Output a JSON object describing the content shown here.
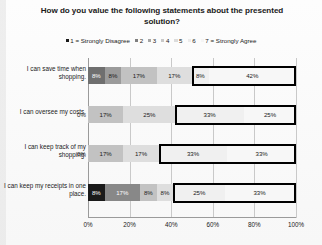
{
  "chart_data": {
    "type": "bar",
    "subtype": "100%-stacked-horizontal-bar",
    "title": "How do you value the following statements about the presented solution?",
    "xlabel": "",
    "ylabel": "",
    "xlim": [
      0,
      100
    ],
    "xticks": [
      "0%",
      "20%",
      "40%",
      "60%",
      "80%",
      "100%"
    ],
    "xtick_values": [
      0,
      20,
      40,
      60,
      80,
      100
    ],
    "grid": true,
    "legend_position": "top",
    "legend": [
      {
        "label": "1 = Strongly Disagree",
        "color": "#1a1a1a"
      },
      {
        "label": "2",
        "color": "#7f7f7f"
      },
      {
        "label": "3",
        "color": "#a6a6a6"
      },
      {
        "label": "4",
        "color": "#c9c9c9"
      },
      {
        "label": "5",
        "color": "#dcdcdc"
      },
      {
        "label": "6",
        "color": "#ebebeb"
      },
      {
        "label": "7 = Strongly Agree",
        "color": "#f5f5f5"
      }
    ],
    "categories": [
      "I can save time when shopping.",
      "I can oversee my costs.",
      "I can keep track of my shopping.",
      "I can keep my receipts in one place."
    ],
    "series": [
      {
        "name": "1 = Strongly Disagree",
        "color": "#1a1a1a",
        "values": [
          8,
          0,
          0,
          8
        ]
      },
      {
        "name": "2",
        "color": "#7f7f7f",
        "values": [
          8,
          17,
          17,
          17
        ]
      },
      {
        "name": "3",
        "color": "#a6a6a6",
        "values": [
          17,
          25,
          17,
          0
        ]
      },
      {
        "name": "4",
        "color": "#c9c9c9",
        "values": [
          17,
          0,
          0,
          8
        ]
      },
      {
        "name": "5",
        "color": "#dcdcdc",
        "values": [
          8,
          33,
          33,
          8
        ]
      },
      {
        "name": "6",
        "color": "#ebebeb",
        "values": [
          0,
          0,
          0,
          25
        ]
      },
      {
        "name": "7 = Strongly Agree",
        "color": "#f5f5f5",
        "values": [
          42,
          25,
          33,
          33
        ]
      }
    ],
    "bars": [
      {
        "category": "I can save time when shopping.",
        "segments": [
          {
            "series": "1",
            "value": 8,
            "label": "8%",
            "color": "#6f6f6f",
            "label_color": "#ffffff",
            "outside": false
          },
          {
            "series": "2",
            "value": 8,
            "label": "8%",
            "color": "#9b9b9b",
            "label_color": "#1a1a1a",
            "outside": false
          },
          {
            "series": "3",
            "value": 17,
            "label": "17%",
            "color": "#c2c2c2",
            "label_color": "#1a1a1a",
            "outside": false
          },
          {
            "series": "4",
            "value": 17,
            "label": "17%",
            "color": "#dedede",
            "label_color": "#1a1a1a",
            "outside": false
          },
          {
            "series": "5",
            "value": 8,
            "label": "8%",
            "color": "#f0f0f0",
            "label_color": "#1a1a1a",
            "outside": false
          },
          {
            "series": "7",
            "value": 42,
            "label": "42%",
            "color": "#f7f7f7",
            "label_color": "#1a1a1a",
            "outside": false
          }
        ],
        "highlight": {
          "start": 50,
          "end": 100
        }
      },
      {
        "category": "I can oversee my costs.",
        "segments": [
          {
            "series": "1",
            "value": 0,
            "label": "0%",
            "color": "#1a1a1a",
            "label_color": "#1a1a1a",
            "outside": true
          },
          {
            "series": "2",
            "value": 17,
            "label": "17%",
            "color": "#c2c2c2",
            "label_color": "#1a1a1a",
            "outside": false
          },
          {
            "series": "3",
            "value": 25,
            "label": "25%",
            "color": "#dedede",
            "label_color": "#1a1a1a",
            "outside": false
          },
          {
            "series": "5",
            "value": 33,
            "label": "33%",
            "color": "#f0f0f0",
            "label_color": "#1a1a1a",
            "outside": false
          },
          {
            "series": "7",
            "value": 25,
            "label": "25%",
            "color": "#f7f7f7",
            "label_color": "#1a1a1a",
            "outside": false
          }
        ],
        "highlight": {
          "start": 42,
          "end": 100
        }
      },
      {
        "category": "I can keep track of my shopping.",
        "segments": [
          {
            "series": "1",
            "value": 0,
            "label": "0%",
            "color": "#1a1a1a",
            "label_color": "#1a1a1a",
            "outside": true
          },
          {
            "series": "2",
            "value": 17,
            "label": "17%",
            "color": "#c2c2c2",
            "label_color": "#1a1a1a",
            "outside": false
          },
          {
            "series": "3",
            "value": 17,
            "label": "17%",
            "color": "#dedede",
            "label_color": "#1a1a1a",
            "outside": false
          },
          {
            "series": "5",
            "value": 33,
            "label": "33%",
            "color": "#f0f0f0",
            "label_color": "#1a1a1a",
            "outside": false
          },
          {
            "series": "7",
            "value": 33,
            "label": "33%",
            "color": "#f7f7f7",
            "label_color": "#1a1a1a",
            "outside": false
          }
        ],
        "highlight": {
          "start": 34,
          "end": 100
        }
      },
      {
        "category": "I can keep my receipts in one place.",
        "segments": [
          {
            "series": "1",
            "value": 8,
            "label": "8%",
            "color": "#1a1a1a",
            "label_color": "#ffffff",
            "outside": false
          },
          {
            "series": "2",
            "value": 17,
            "label": "17%",
            "color": "#888888",
            "label_color": "#ffffff",
            "outside": false
          },
          {
            "series": "3",
            "value": 0,
            "label": "0%",
            "color": "#a6a6a6",
            "label_color": "#1a1a1a",
            "outside": false
          },
          {
            "series": "4",
            "value": 8,
            "label": "8%",
            "color": "#c2c2c2",
            "label_color": "#1a1a1a",
            "outside": false
          },
          {
            "series": "5",
            "value": 8,
            "label": "8%",
            "color": "#dedede",
            "label_color": "#1a1a1a",
            "outside": false
          },
          {
            "series": "6",
            "value": 25,
            "label": "25%",
            "color": "#f0f0f0",
            "label_color": "#1a1a1a",
            "outside": false
          },
          {
            "series": "7",
            "value": 33,
            "label": "33%",
            "color": "#f7f7f7",
            "label_color": "#1a1a1a",
            "outside": false
          }
        ],
        "highlight": {
          "start": 41,
          "end": 100
        }
      }
    ]
  }
}
